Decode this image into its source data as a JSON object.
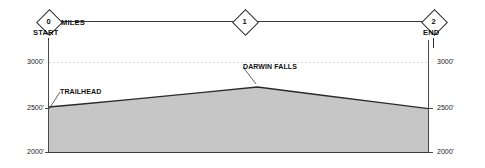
{
  "chart_data": {
    "type": "area",
    "title": "",
    "subtitle": "",
    "xlabel": "MILES",
    "ylabel": "",
    "xlim": [
      0,
      2
    ],
    "ylim": [
      2000,
      3000
    ],
    "grid": true,
    "legend_position": "none",
    "x_unit": "miles",
    "y_unit": "feet",
    "x_tick_labels": [
      "0",
      "1",
      "2"
    ],
    "x_tick_values": [
      0,
      1,
      2
    ],
    "y_tick_labels_left": [
      "3000'",
      "2500'",
      "2000'"
    ],
    "y_tick_labels_right": [
      "3000'",
      "2500'",
      "2000'"
    ],
    "y_tick_values": [
      3000,
      2500,
      2000
    ],
    "series": [
      {
        "name": "Trail elevation profile",
        "fill_color": "#c6c6c6",
        "line_color": "#2b2b2b",
        "x": [
          0,
          0.15,
          0.45,
          0.8,
          1.1,
          1.45,
          1.75,
          2.0
        ],
        "values": [
          2500,
          2528,
          2588,
          2660,
          2722,
          2628,
          2548,
          2482
        ]
      }
    ],
    "annotations": [
      {
        "label": "TRAILHEAD",
        "x": 0,
        "y": 2500,
        "label_x_px": 60,
        "label_y_px": 92,
        "leader_to_x_px": 49,
        "leader_to_y_px": 109
      },
      {
        "label": "DARWIN FALLS",
        "x": 1.1,
        "y": 2722,
        "label_x_px": 243,
        "label_y_px": 67,
        "leader_to_x_px": 256,
        "leader_to_y_px": 84
      }
    ]
  },
  "mile_scale": {
    "axis_label": "MILES",
    "markers": [
      {
        "id": "start",
        "number": "0",
        "endpoint_label": "START"
      },
      {
        "id": "mid",
        "number": "1",
        "endpoint_label": ""
      },
      {
        "id": "end",
        "number": "2",
        "endpoint_label": "END"
      }
    ]
  },
  "axes": {
    "left_labels": [
      "3000'",
      "2500'",
      "2000'"
    ],
    "right_labels": [
      "3000'",
      "2500'",
      "2000'"
    ]
  }
}
